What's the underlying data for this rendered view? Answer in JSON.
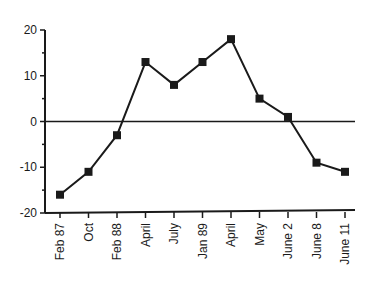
{
  "chart_data": {
    "type": "line",
    "title": "",
    "xlabel": "",
    "ylabel": "",
    "categories": [
      "Feb 87",
      "Oct",
      "Feb 88",
      "April",
      "July",
      "Jan 89",
      "April",
      "May",
      "June 2",
      "June 8",
      "June 11"
    ],
    "series": [
      {
        "name": "series",
        "values": [
          -16,
          -11,
          -3,
          13,
          8,
          13,
          18,
          5,
          1,
          -9,
          -11
        ],
        "marker": "square",
        "color": "#1a1a1a"
      }
    ],
    "ylim": [
      -20,
      20
    ],
    "yticks": [
      -20,
      -10,
      0,
      10,
      20
    ],
    "ytick_labels": [
      "-20",
      "-10",
      "0",
      "10",
      "20"
    ],
    "zero_line": true,
    "grid": false,
    "legend": "none"
  }
}
